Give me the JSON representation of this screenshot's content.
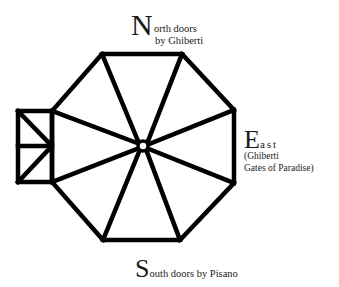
{
  "diagram": {
    "colors": {
      "stroke": "#000000",
      "text": "#1a1a1a",
      "background": "#ffffff"
    },
    "labels": {
      "north": {
        "cap": "N",
        "line1": "orth doors",
        "line2": "by Ghiberti"
      },
      "east": {
        "cap": "E",
        "line1": "ast",
        "line2": "(Ghiberti",
        "line3": "Gates of Paradise)"
      },
      "south": {
        "cap": "S",
        "line1": "outh doors by Pisano"
      }
    }
  }
}
